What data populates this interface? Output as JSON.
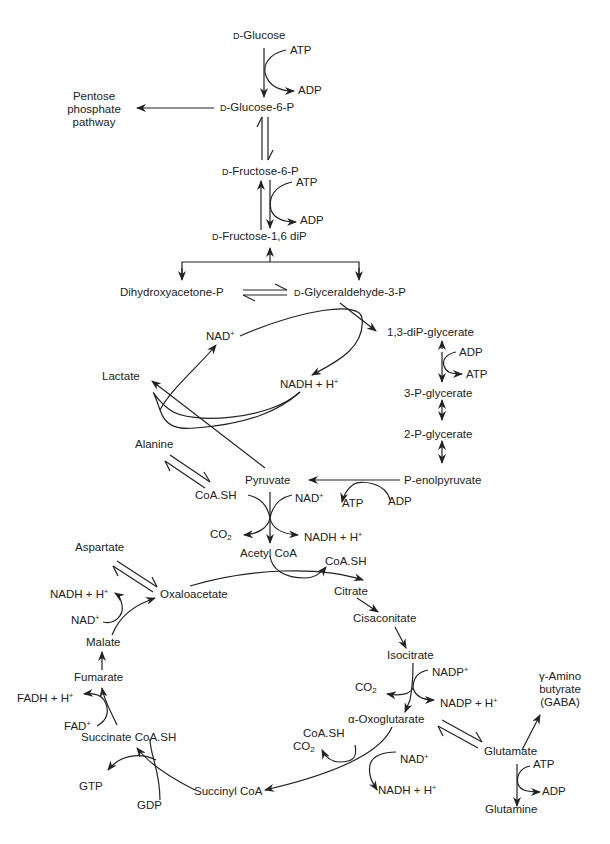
{
  "diagram": {
    "type": "metabolic-pathway",
    "colors": {
      "ink": "#222222",
      "background": "#ffffff"
    },
    "nodes": {
      "glucose": {
        "prefix": "D",
        "label": "-Glucose"
      },
      "atp1": "ATP",
      "adp1": "ADP",
      "pentose": {
        "line1": "Pentose",
        "line2": "phosphate",
        "line3": "pathway"
      },
      "g6p": {
        "prefix": "D",
        "label": "-Glucose-6-P"
      },
      "f6p": {
        "prefix": "D",
        "label": "-Fructose-6-P"
      },
      "atp2": "ATP",
      "adp2": "ADP",
      "f16dp": {
        "prefix": "D",
        "label": "-Fructose-1,6 diP"
      },
      "dhap": "Dihydroxyacetone-P",
      "g3p": {
        "prefix": "D",
        "label": "-Glyceraldehyde-3-P"
      },
      "nad_glyc": {
        "base": "NAD",
        "sup": "+"
      },
      "nadh_glyc": {
        "base": "NADH + H",
        "sup": "+"
      },
      "bpg": "1,3-diP-glycerate",
      "adp3": "ADP",
      "atp3": "ATP",
      "pg3": "3-P-glycerate",
      "pg2": "2-P-glycerate",
      "pep": "P-enolpyruvate",
      "atp4": "ATP",
      "adp4": "ADP",
      "lactate": "Lactate",
      "alanine": "Alanine",
      "pyruvate": "Pyruvate",
      "coash_pdh": "CoA.SH",
      "nad_pdh": {
        "base": "NAD",
        "sup": "+"
      },
      "co2_pdh": {
        "base": "CO",
        "sub": "2"
      },
      "nadh_pdh": {
        "base": "NADH + H",
        "sup": "+"
      },
      "acetylcoa": "Acetyl CoA",
      "aspartate": "Aspartate",
      "oxaloacetate": "Oxaloacetate",
      "coash_cs": "CoA.SH",
      "citrate": "Citrate",
      "cisaconitate": "Cisaconitate",
      "isocitrate": "Isocitrate",
      "nadp_idh": {
        "base": "NADP",
        "sup": "+"
      },
      "co2_idh": {
        "base": "CO",
        "sub": "2"
      },
      "nadph_idh": {
        "base": "NADP + H",
        "sup": "+"
      },
      "gaba": {
        "line1": "γ-Amino",
        "line2": "butyrate",
        "line3": "(GABA)"
      },
      "akg": "α-Oxoglutarate",
      "coash_akg": "CoA.SH",
      "co2_akg": {
        "base": "CO",
        "sub": "2"
      },
      "nad_akg": {
        "base": "NAD",
        "sup": "+"
      },
      "nadh_akg": {
        "base": "NADH + H",
        "sup": "+"
      },
      "glutamate": "Glutamate",
      "atp5": "ATP",
      "adp5": "ADP",
      "glutamine": "Glutamine",
      "succinylcoa": "Succinyl CoA",
      "succinate": "Succinate CoA.SH",
      "gtp": "GTP",
      "gdp": "GDP",
      "fad": {
        "base": "FAD",
        "sup": "+"
      },
      "fadh": {
        "base": "FADH + H",
        "sup": "+"
      },
      "fumarate": "Fumarate",
      "malate": "Malate",
      "nad_mdh": {
        "base": "NAD",
        "sup": "+"
      },
      "nadh_mdh": {
        "base": "NADH + H",
        "sup": "+"
      }
    }
  }
}
